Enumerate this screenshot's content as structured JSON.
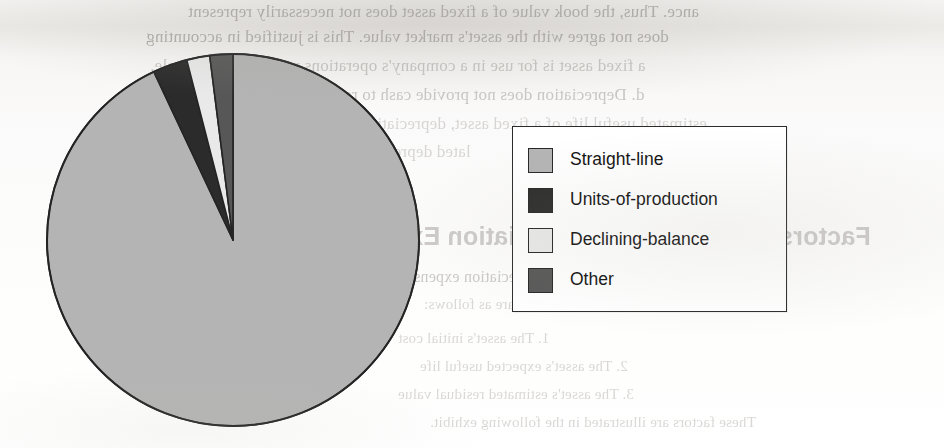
{
  "page": {
    "background_color": "#ffffff",
    "paper_tint": "#f6f5f3",
    "bleed_through_text": [
      "ance. Thus, the book value of a fixed asset does not necessarily represent",
      "does not agree with the asset's market value. This is justified in accounting",
      "a fixed asset is for use in a company's operations rather than for resale.",
      "d. Depreciation does not provide cash to replace fixed assets. Over the",
      "estimated useful life of a fixed asset, depreciation expense and accumu-",
      "lated depreciation are recorded.",
      "Factors in Computing Depreciation Expense",
      "Three factors determine the depreciation expense for a fixed asset. These",
      "factors are as follows:",
      "1. The asset's initial cost",
      "2. The asset's expected useful life",
      "3. The asset's estimated residual value",
      "These factors are illustrated in the following exhibit."
    ]
  },
  "chart_data": {
    "type": "pie",
    "title": "",
    "labels": [
      "Straight-line",
      "Units-of-production",
      "Declining-balance",
      "Other"
    ],
    "values": [
      93,
      3,
      2,
      2
    ],
    "unit": "%",
    "legend_position": "right",
    "grid": false,
    "start_angle_deg": 0,
    "direction": "counterclockwise",
    "slices": [
      {
        "label": "Straight-line",
        "value": 93,
        "color": "#b4b4b4",
        "start_deg": 0,
        "sweep_deg": 334.8
      },
      {
        "label": "Units-of-production",
        "value": 3,
        "color": "#2b2b2b",
        "start_deg": 334.8,
        "sweep_deg": 10.8
      },
      {
        "label": "Declining-balance",
        "value": 2,
        "color": "#e9e9e9",
        "start_deg": 345.6,
        "sweep_deg": 7.2
      },
      {
        "label": "Other",
        "value": 2,
        "color": "#575757",
        "start_deg": 352.8,
        "sweep_deg": 7.2
      }
    ],
    "outline_color": "#242424",
    "geometry": {
      "center_x": 233,
      "center_y": 240,
      "radius": 186
    }
  },
  "legend": {
    "border_color": "#2b2b2b",
    "background": "#ffffff",
    "entries": [
      {
        "label": "Straight-line",
        "color": "#b4b4b4"
      },
      {
        "label": "Units-of-production",
        "color": "#2b2b2b"
      },
      {
        "label": "Declining-balance",
        "color": "#e9e9e9"
      },
      {
        "label": "Other",
        "color": "#575757"
      }
    ]
  }
}
